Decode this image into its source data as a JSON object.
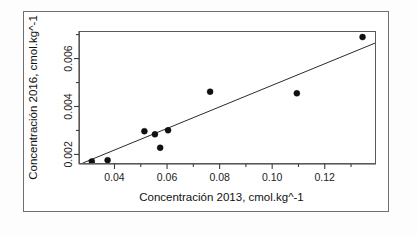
{
  "figure": {
    "background_color": "#ffffff",
    "border_color": "#6f6f6f",
    "plot_border_color": "#5a5a5a",
    "point_color": "#111111",
    "line_color": "#2a2a2a"
  },
  "chart_data": {
    "type": "scatter",
    "title": "",
    "xlabel": "Concentración 2013, cmol.kg^-1",
    "ylabel": "Concentración 2016, cmol.kg^-1",
    "xlim": [
      0.0265,
      0.1395
    ],
    "ylim": [
      0.0016,
      0.00715
    ],
    "xticks": [
      0.04,
      0.06,
      0.08,
      0.1,
      0.12
    ],
    "xtick_labels": [
      "0.04",
      "0.06",
      "0.08",
      "0.10",
      "0.12"
    ],
    "x_minor_ticks": [
      0.05,
      0.07,
      0.09,
      0.11,
      0.13
    ],
    "yticks": [
      0.002,
      0.004,
      0.006
    ],
    "ytick_labels": [
      "0.002",
      "0.004",
      "0.006"
    ],
    "y_minor_ticks": [
      0.003,
      0.005,
      0.007
    ],
    "grid": false,
    "legend": null,
    "points": [
      {
        "x": 0.031,
        "y": 0.00175
      },
      {
        "x": 0.037,
        "y": 0.0018
      },
      {
        "x": 0.051,
        "y": 0.00301
      },
      {
        "x": 0.055,
        "y": 0.00288
      },
      {
        "x": 0.057,
        "y": 0.00232
      },
      {
        "x": 0.06,
        "y": 0.00305
      },
      {
        "x": 0.076,
        "y": 0.00466
      },
      {
        "x": 0.109,
        "y": 0.00459
      },
      {
        "x": 0.134,
        "y": 0.00694
      }
    ],
    "fit_line": {
      "type": "linear-regression",
      "x_start": 0.0275,
      "y_start": 0.00168,
      "x_end": 0.1395,
      "y_end": 0.00672
    }
  }
}
